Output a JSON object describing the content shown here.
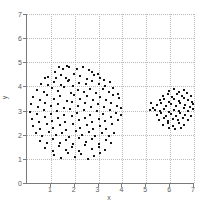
{
  "figure": {
    "background": "#ffffff",
    "colors": {
      "marker": "#161616",
      "axis_line": "#7a7a7a",
      "gridline": "#bcbcbc",
      "tick_text": "#5a5a5a"
    }
  },
  "chart_data": {
    "type": "scatter",
    "title": "",
    "xlabel": "x",
    "ylabel": "y",
    "xlim": [
      0,
      7
    ],
    "ylim": [
      0,
      7
    ],
    "grid": true,
    "legend": false,
    "xticks": [
      1,
      2,
      3,
      4,
      5,
      6,
      7
    ],
    "yticks": [
      0,
      1,
      2,
      3,
      4,
      5,
      6,
      7
    ],
    "grid_x": [
      1,
      2,
      3,
      4,
      5,
      6,
      7
    ],
    "grid_y": [
      1,
      2,
      3,
      4,
      5,
      6,
      7
    ],
    "marker": {
      "shape": "square-dot",
      "size_px": 2,
      "color": "#161616"
    },
    "series": [
      {
        "name": "cluster-1",
        "points": [
          [
            1.35,
            4.82
          ],
          [
            1.52,
            4.74
          ],
          [
            1.68,
            4.85
          ],
          [
            1.74,
            4.8
          ],
          [
            2.1,
            4.73
          ],
          [
            2.34,
            4.79
          ],
          [
            2.58,
            4.68
          ],
          [
            1.16,
            4.6
          ],
          [
            2.74,
            4.58
          ],
          [
            2.96,
            4.52
          ],
          [
            0.9,
            4.41
          ],
          [
            1.2,
            4.33
          ],
          [
            1.44,
            4.49
          ],
          [
            1.63,
            4.36
          ],
          [
            1.97,
            4.52
          ],
          [
            2.24,
            4.43
          ],
          [
            2.52,
            4.31
          ],
          [
            2.8,
            4.47
          ],
          [
            3.06,
            4.36
          ],
          [
            3.24,
            4.28
          ],
          [
            0.74,
            4.34
          ],
          [
            1.78,
            4.26
          ],
          [
            0.58,
            4.12
          ],
          [
            0.86,
            4.04
          ],
          [
            1.14,
            4.19
          ],
          [
            1.42,
            4.06
          ],
          [
            1.7,
            4.23
          ],
          [
            1.94,
            4.01
          ],
          [
            2.17,
            4.14
          ],
          [
            2.47,
            4.08
          ],
          [
            2.72,
            4.21
          ],
          [
            3.0,
            4.09
          ],
          [
            3.27,
            4.03
          ],
          [
            3.47,
            4.17
          ],
          [
            0.4,
            3.87
          ],
          [
            0.72,
            3.77
          ],
          [
            1.04,
            3.93
          ],
          [
            1.32,
            3.79
          ],
          [
            1.57,
            3.96
          ],
          [
            1.84,
            3.71
          ],
          [
            2.12,
            3.86
          ],
          [
            2.4,
            3.75
          ],
          [
            2.64,
            3.91
          ],
          [
            2.9,
            3.73
          ],
          [
            3.17,
            3.89
          ],
          [
            3.44,
            3.77
          ],
          [
            3.62,
            3.93
          ],
          [
            3.8,
            3.69
          ],
          [
            0.27,
            3.56
          ],
          [
            0.56,
            3.44
          ],
          [
            0.84,
            3.63
          ],
          [
            1.12,
            3.47
          ],
          [
            1.4,
            3.59
          ],
          [
            1.67,
            3.41
          ],
          [
            1.97,
            3.66
          ],
          [
            2.24,
            3.49
          ],
          [
            2.52,
            3.61
          ],
          [
            2.77,
            3.43
          ],
          [
            3.04,
            3.57
          ],
          [
            3.32,
            3.45
          ],
          [
            3.6,
            3.63
          ],
          [
            3.84,
            3.51
          ],
          [
            0.17,
            3.26
          ],
          [
            0.46,
            3.14
          ],
          [
            0.74,
            3.33
          ],
          [
            1.02,
            3.17
          ],
          [
            1.3,
            3.29
          ],
          [
            1.57,
            3.11
          ],
          [
            1.87,
            3.36
          ],
          [
            2.14,
            3.19
          ],
          [
            2.42,
            3.31
          ],
          [
            2.7,
            3.13
          ],
          [
            2.97,
            3.27
          ],
          [
            3.24,
            3.15
          ],
          [
            3.52,
            3.33
          ],
          [
            3.77,
            3.21
          ],
          [
            3.94,
            3.1
          ],
          [
            0.14,
            2.96
          ],
          [
            0.44,
            2.84
          ],
          [
            0.72,
            3.03
          ],
          [
            1.0,
            2.87
          ],
          [
            1.27,
            2.99
          ],
          [
            1.54,
            2.81
          ],
          [
            1.82,
            3.06
          ],
          [
            2.1,
            2.89
          ],
          [
            2.37,
            3.01
          ],
          [
            2.64,
            2.83
          ],
          [
            2.92,
            2.97
          ],
          [
            3.2,
            2.85
          ],
          [
            3.47,
            3.03
          ],
          [
            3.74,
            2.91
          ],
          [
            3.96,
            2.8
          ],
          [
            0.22,
            2.66
          ],
          [
            0.5,
            2.54
          ],
          [
            0.77,
            2.73
          ],
          [
            1.04,
            2.57
          ],
          [
            1.32,
            2.69
          ],
          [
            1.6,
            2.51
          ],
          [
            1.9,
            2.76
          ],
          [
            2.17,
            2.59
          ],
          [
            2.44,
            2.71
          ],
          [
            2.72,
            2.53
          ],
          [
            3.0,
            2.67
          ],
          [
            3.27,
            2.55
          ],
          [
            3.54,
            2.73
          ],
          [
            3.82,
            2.61
          ],
          [
            0.27,
            2.36
          ],
          [
            0.54,
            2.24
          ],
          [
            0.82,
            2.43
          ],
          [
            1.1,
            2.27
          ],
          [
            1.37,
            2.39
          ],
          [
            1.64,
            2.21
          ],
          [
            1.94,
            2.46
          ],
          [
            2.22,
            2.29
          ],
          [
            2.5,
            2.41
          ],
          [
            2.77,
            2.23
          ],
          [
            3.04,
            2.37
          ],
          [
            3.32,
            2.25
          ],
          [
            3.57,
            2.43
          ],
          [
            0.37,
            2.06
          ],
          [
            0.64,
            1.94
          ],
          [
            0.92,
            2.13
          ],
          [
            1.2,
            1.97
          ],
          [
            1.47,
            2.09
          ],
          [
            1.74,
            1.91
          ],
          [
            2.04,
            2.16
          ],
          [
            2.32,
            1.99
          ],
          [
            2.6,
            2.11
          ],
          [
            2.87,
            1.93
          ],
          [
            3.14,
            2.07
          ],
          [
            3.42,
            1.95
          ],
          [
            3.64,
            2.09
          ],
          [
            0.54,
            1.76
          ],
          [
            0.82,
            1.64
          ],
          [
            1.1,
            1.83
          ],
          [
            1.37,
            1.67
          ],
          [
            1.64,
            1.79
          ],
          [
            1.92,
            1.61
          ],
          [
            2.2,
            1.86
          ],
          [
            2.47,
            1.69
          ],
          [
            2.74,
            1.81
          ],
          [
            3.02,
            1.63
          ],
          [
            3.3,
            1.77
          ],
          [
            3.52,
            1.67
          ],
          [
            0.77,
            1.46
          ],
          [
            1.07,
            1.34
          ],
          [
            1.34,
            1.53
          ],
          [
            1.62,
            1.37
          ],
          [
            1.9,
            1.49
          ],
          [
            2.17,
            1.31
          ],
          [
            2.44,
            1.56
          ],
          [
            2.72,
            1.39
          ],
          [
            3.0,
            1.51
          ],
          [
            3.26,
            1.35
          ],
          [
            1.14,
            1.16
          ],
          [
            1.44,
            1.04
          ],
          [
            1.72,
            1.23
          ],
          [
            2.0,
            1.07
          ],
          [
            2.27,
            1.19
          ],
          [
            2.54,
            1.01
          ],
          [
            2.82,
            1.11
          ],
          [
            3.06,
            1.24
          ]
        ]
      },
      {
        "name": "cluster-2",
        "points": [
          [
            5.95,
            3.82
          ],
          [
            6.16,
            3.88
          ],
          [
            6.36,
            3.77
          ],
          [
            6.56,
            3.84
          ],
          [
            5.72,
            3.62
          ],
          [
            5.91,
            3.7
          ],
          [
            6.09,
            3.57
          ],
          [
            6.29,
            3.67
          ],
          [
            6.49,
            3.59
          ],
          [
            6.69,
            3.71
          ],
          [
            6.86,
            3.61
          ],
          [
            5.56,
            3.42
          ],
          [
            5.76,
            3.5
          ],
          [
            5.96,
            3.37
          ],
          [
            6.16,
            3.47
          ],
          [
            6.36,
            3.39
          ],
          [
            6.56,
            3.51
          ],
          [
            6.76,
            3.43
          ],
          [
            6.93,
            3.37
          ],
          [
            5.43,
            3.22
          ],
          [
            5.63,
            3.3
          ],
          [
            5.83,
            3.17
          ],
          [
            6.03,
            3.27
          ],
          [
            6.23,
            3.19
          ],
          [
            6.43,
            3.31
          ],
          [
            6.63,
            3.23
          ],
          [
            6.83,
            3.15
          ],
          [
            6.97,
            3.27
          ],
          [
            5.36,
            3.01
          ],
          [
            5.56,
            2.97
          ],
          [
            5.76,
            3.07
          ],
          [
            5.96,
            2.95
          ],
          [
            6.16,
            3.04
          ],
          [
            6.36,
            2.97
          ],
          [
            6.56,
            3.09
          ],
          [
            6.76,
            2.99
          ],
          [
            6.94,
            3.05
          ],
          [
            5.43,
            2.81
          ],
          [
            5.63,
            2.89
          ],
          [
            5.83,
            2.77
          ],
          [
            6.03,
            2.87
          ],
          [
            6.23,
            2.79
          ],
          [
            6.43,
            2.91
          ],
          [
            6.63,
            2.83
          ],
          [
            6.86,
            2.77
          ],
          [
            5.53,
            2.61
          ],
          [
            5.73,
            2.69
          ],
          [
            5.93,
            2.57
          ],
          [
            6.13,
            2.67
          ],
          [
            6.33,
            2.59
          ],
          [
            6.53,
            2.71
          ],
          [
            6.76,
            2.63
          ],
          [
            5.69,
            2.41
          ],
          [
            5.91,
            2.49
          ],
          [
            6.13,
            2.37
          ],
          [
            6.36,
            2.47
          ],
          [
            6.59,
            2.39
          ],
          [
            5.96,
            2.27
          ],
          [
            6.21,
            2.24
          ],
          [
            6.46,
            2.29
          ],
          [
            5.18,
            3.32
          ],
          [
            5.14,
            3.04
          ],
          [
            5.3,
            3.12
          ]
        ]
      }
    ]
  }
}
